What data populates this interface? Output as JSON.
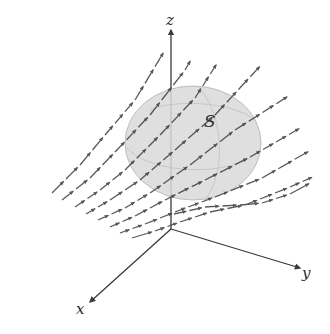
{
  "figure": {
    "surface_label": "S",
    "axes": {
      "origin": [
        171,
        229
      ],
      "x": {
        "label": "x",
        "end": [
          90,
          302
        ],
        "label_pos": [
          76,
          314
        ]
      },
      "y": {
        "label": "y",
        "end": [
          300,
          268
        ],
        "label_pos": [
          302,
          278
        ]
      },
      "z": {
        "label": "z",
        "end": [
          171,
          30
        ],
        "label_pos": [
          166,
          25
        ]
      }
    },
    "colors": {
      "line": "#3a3a3a",
      "surface_fill": "#d9d9d9",
      "surface_edge": "#bdbdbd",
      "background": "#ffffff"
    },
    "surface": {
      "center": [
        193,
        143
      ],
      "rx": 68,
      "ry": 57
    },
    "streamlines": [
      [
        [
          52,
          193
        ],
        [
          80,
          165
        ],
        [
          105,
          135
        ],
        [
          135,
          100
        ],
        [
          165,
          50
        ]
      ],
      [
        [
          62,
          200
        ],
        [
          90,
          178
        ],
        [
          115,
          152
        ],
        [
          150,
          115
        ],
        [
          185,
          70
        ],
        [
          192,
          58
        ]
      ],
      [
        [
          75,
          207
        ],
        [
          100,
          190
        ],
        [
          125,
          170
        ],
        [
          160,
          135
        ],
        [
          195,
          98
        ],
        [
          218,
          62
        ]
      ],
      [
        [
          86,
          214
        ],
        [
          110,
          200
        ],
        [
          140,
          180
        ],
        [
          175,
          150
        ],
        [
          215,
          115
        ],
        [
          262,
          64
        ]
      ],
      [
        [
          98,
          220
        ],
        [
          125,
          208
        ],
        [
          150,
          193
        ],
        [
          190,
          165
        ],
        [
          235,
          130
        ],
        [
          290,
          95
        ]
      ],
      [
        [
          110,
          227
        ],
        [
          135,
          216
        ],
        [
          165,
          200
        ],
        [
          205,
          180
        ],
        [
          250,
          157
        ],
        [
          302,
          127
        ]
      ],
      [
        [
          120,
          233
        ],
        [
          145,
          224
        ],
        [
          175,
          212
        ],
        [
          215,
          197
        ],
        [
          262,
          178
        ],
        [
          311,
          150
        ]
      ],
      [
        [
          132,
          238
        ],
        [
          155,
          231
        ],
        [
          180,
          222
        ],
        [
          210,
          212
        ],
        [
          245,
          205
        ],
        [
          290,
          187
        ],
        [
          315,
          176
        ]
      ]
    ],
    "streamline_bottom": [
      [
        174,
        214
      ],
      [
        205,
        207
      ],
      [
        240,
        205
      ],
      [
        262,
        203
      ],
      [
        290,
        194
      ],
      [
        312,
        182
      ]
    ]
  }
}
